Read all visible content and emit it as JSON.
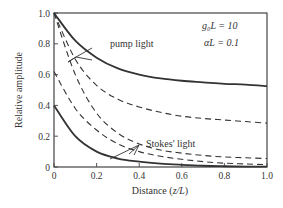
{
  "chart_data": {
    "type": "line",
    "title": "",
    "xlabel": "Distance (z/L)",
    "ylabel": "Relative amplitude",
    "xlim": [
      0,
      1.0
    ],
    "ylim": [
      0,
      1.0
    ],
    "xticks": [
      "0",
      "0.2",
      "0.4",
      "0.6",
      "0.8",
      "1.0"
    ],
    "yticks": [
      "0",
      "0.2",
      "0.4",
      "0.6",
      "0.8",
      "1.0"
    ],
    "grid": false,
    "annotations": [
      {
        "text": "pump light",
        "target": "pump curves"
      },
      {
        "text": "Stokes' light",
        "target": "Stokes curves"
      },
      {
        "text": "g0L=10",
        "position": "top-right"
      },
      {
        "text": "αL=0.1",
        "position": "top-right"
      }
    ],
    "x": [
      0,
      0.1,
      0.2,
      0.3,
      0.4,
      0.5,
      0.6,
      0.7,
      0.8,
      0.9,
      1.0
    ],
    "series": [
      {
        "name": "pump light (solid)",
        "style": "solid",
        "values": [
          1.0,
          0.82,
          0.71,
          0.64,
          0.6,
          0.575,
          0.56,
          0.55,
          0.54,
          0.535,
          0.525
        ]
      },
      {
        "name": "pump light (dashed, upper)",
        "style": "dashed",
        "values": [
          1.0,
          0.7,
          0.53,
          0.44,
          0.39,
          0.355,
          0.33,
          0.315,
          0.305,
          0.295,
          0.285
        ]
      },
      {
        "name": "pump light (dashed, lower)",
        "style": "dashed",
        "values": [
          1.0,
          0.6,
          0.35,
          0.22,
          0.15,
          0.11,
          0.09,
          0.075,
          0.065,
          0.06,
          0.055
        ]
      },
      {
        "name": "Stokes' light (solid)",
        "style": "solid",
        "values": [
          0.4,
          0.2,
          0.1,
          0.055,
          0.035,
          0.022,
          0.014,
          0.008,
          0.005,
          0.003,
          0.002
        ]
      },
      {
        "name": "Stokes' light (dashed)",
        "style": "dashed",
        "values": [
          0.62,
          0.38,
          0.24,
          0.15,
          0.1,
          0.07,
          0.05,
          0.035,
          0.025,
          0.02,
          0.015
        ]
      }
    ]
  },
  "labels": {
    "ylabel": "Relative amplitude",
    "xlabel_prefix": "Distance (",
    "xlabel_var": "z/L",
    "xlabel_suffix": ")",
    "pump": "pump light",
    "stokes": "Stokes' light",
    "param1": "g₀L = 10",
    "param2": "αL = 0.1"
  }
}
